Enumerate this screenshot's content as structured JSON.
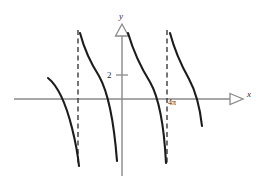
{
  "figure": {
    "kind": "function-graph",
    "background_color": "#ffffff"
  },
  "labels": {
    "y_axis": "y",
    "x_axis": "x",
    "y_tick_2": "2",
    "x_tick_4pi": "4π"
  },
  "colors": {
    "axis": "#8a8a8a",
    "curve": "#1c1c1c",
    "asymptote": "#3a3a3a",
    "text": "#2b2b2b"
  },
  "chart_data": {
    "type": "line",
    "title": "",
    "xlabel": "x",
    "ylabel": "y",
    "grid": false,
    "legend": null,
    "axes": {
      "x_axis_y_px": 99,
      "y_axis_x_px": 122,
      "x_axis_from_px": 14,
      "x_axis_to_px": 234,
      "y_axis_from_px": 27,
      "y_axis_to_px": 176
    },
    "x_ticks": [
      {
        "label": "4π",
        "x_px": 167
      }
    ],
    "y_ticks": [
      {
        "label": "2",
        "value": 2,
        "y_px": 75
      }
    ],
    "asymptotes": [
      {
        "x_px": 78,
        "style": "dashed",
        "y_top_px": 30,
        "y_bottom_px": 166
      },
      {
        "x_px": 167,
        "style": "dashed",
        "y_top_px": 30,
        "y_bottom_px": 166
      }
    ],
    "branches": [
      {
        "name": "branch-1",
        "path": "M 48,78 C 58,86 66,104 72,128 C 76,144 78,156 79,166"
      },
      {
        "name": "branch-2",
        "path": "M 80,33 C 84,48 90,62 99,76 C 108,92 114,122 117,161"
      },
      {
        "name": "branch-3",
        "path": "M 128,33 C 133,50 140,66 150,82 C 158,96 164,124 166,163"
      },
      {
        "name": "branch-4",
        "path": "M 170,33 C 174,48 180,63 189,79 C 195,90 200,108 202,126"
      }
    ],
    "ylim": [
      null,
      null
    ],
    "xlim": [
      null,
      null
    ]
  }
}
